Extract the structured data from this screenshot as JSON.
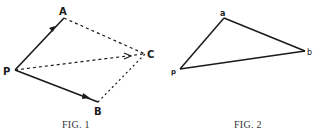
{
  "figures": [
    {
      "id": "fig1",
      "caption": "FIG. 1",
      "labels": {
        "P": "P",
        "A": "A",
        "B": "B",
        "C": "C"
      },
      "description": "Vectors PA and PB (solid, arrowed) with dashed parallelogram completion to C and dashed resultant PC"
    },
    {
      "id": "fig2",
      "caption": "FIG. 2",
      "labels": {
        "p": "p",
        "a": "a",
        "b": "b"
      },
      "description": "Solid triangle p-a-b"
    }
  ],
  "colors": {
    "ink": "#1a1a1a",
    "background": "#ffffff"
  }
}
